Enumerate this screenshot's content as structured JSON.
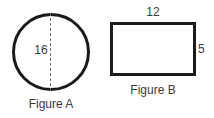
{
  "figure_a": {
    "shape": "circle",
    "caption": "Figure A",
    "dimension_label": "16",
    "dimension_type": "diameter",
    "stroke_color": "#1a1a1a",
    "dash_color": "#6e6e6e",
    "fill_color": "#ffffff"
  },
  "figure_b": {
    "shape": "rectangle",
    "caption": "Figure B",
    "width_label": "12",
    "height_label": "5",
    "stroke_color": "#1a1a1a",
    "fill_color": "#ffffff"
  },
  "page": {
    "background_color": "#ffffff",
    "text_color": "#3a3a3a"
  }
}
